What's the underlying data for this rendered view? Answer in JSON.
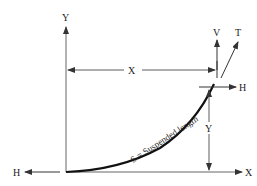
{
  "diagram": {
    "type": "catenary-cable-diagram",
    "labels": {
      "y_axis": "Y",
      "x_axis": "X",
      "h_left": "H",
      "h_right": "H",
      "v_force": "V",
      "t_force": "T",
      "x_dimension": "X",
      "y_dimension": "Y",
      "curve": "S = Suspended length"
    },
    "colors": {
      "line": "#333333",
      "curve": "#111111",
      "text": "#222222",
      "background": "#ffffff"
    }
  }
}
